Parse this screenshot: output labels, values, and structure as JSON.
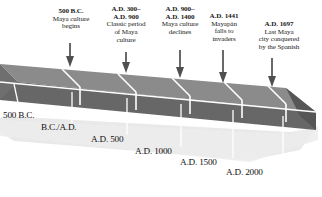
{
  "diagram": {
    "type": "3d-ribbon-timeline",
    "colors": {
      "background": "#ffffff",
      "ribbon_top": "#8b8b8b",
      "ribbon_front": "#676767",
      "ribbon_end": "#585858",
      "divider": "#ffffff",
      "shadow": "#e6e6e6",
      "text": "#111111",
      "arrow": "#4a4a4a"
    },
    "events": [
      {
        "date": "500 B.C.",
        "body": "Maya culture\nbegins",
        "lines": [
          "Maya culture",
          "begins"
        ],
        "arrow": "down-arrow-icon"
      },
      {
        "date": "A.D. 300–\nA.D. 900",
        "date_lines": [
          "A.D. 300–",
          "A.D. 900"
        ],
        "body": "Classic period\nof Maya\nculture",
        "lines": [
          "Classic period",
          "of Maya",
          "culture"
        ],
        "arrow": "down-arrow-icon"
      },
      {
        "date": "A.D. 900–\nA.D. 1400",
        "date_lines": [
          "A.D. 900–",
          "A.D. 1400"
        ],
        "body": "Maya culture\ndeclines",
        "lines": [
          "Maya culture",
          "declines"
        ],
        "arrow": "down-arrow-icon"
      },
      {
        "date": "A.D. 1441",
        "date_lines": [
          "A.D. 1441"
        ],
        "body": "Mayapán\nfalls to\ninvaders",
        "lines": [
          "Mayapán",
          "falls to",
          "invaders"
        ],
        "arrow": "down-arrow-icon"
      },
      {
        "date": "A.D. 1697",
        "date_lines": [
          "A.D. 1697"
        ],
        "body": "Last Maya\ncity conquered\nby the Spanish",
        "lines": [
          "Last Maya",
          "city conquered",
          "by the Spanish"
        ],
        "arrow": "down-arrow-icon"
      }
    ],
    "ticks": [
      {
        "label": "500 B.C."
      },
      {
        "label": "B.C./A.D."
      },
      {
        "label": "A.D. 500"
      },
      {
        "label": "A.D. 1000"
      },
      {
        "label": "A.D. 1500"
      },
      {
        "label": "A.D. 2000"
      }
    ]
  }
}
